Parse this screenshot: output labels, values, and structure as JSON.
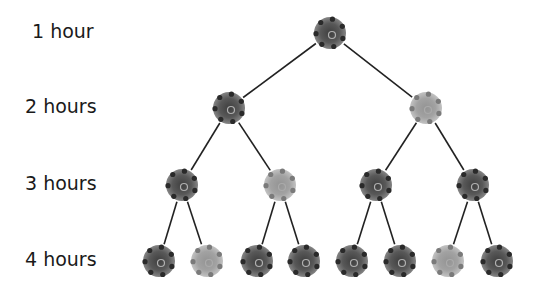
{
  "levels": [
    {
      "label": "1 hour",
      "y": 33,
      "cells": [
        {
          "x": 330,
          "shade": "dark"
        }
      ]
    },
    {
      "label": "2 hours",
      "y": 108,
      "cells": [
        {
          "x": 229,
          "shade": "dark"
        },
        {
          "x": 426,
          "shade": "light"
        }
      ]
    },
    {
      "label": "3 hours",
      "y": 185,
      "cells": [
        {
          "x": 182,
          "shade": "dark"
        },
        {
          "x": 280,
          "shade": "light"
        },
        {
          "x": 376,
          "shade": "dark"
        },
        {
          "x": 473,
          "shade": "dark"
        }
      ]
    },
    {
      "label": "4 hours",
      "y": 261,
      "cells": [
        {
          "x": 159,
          "shade": "dark"
        },
        {
          "x": 207,
          "shade": "light"
        },
        {
          "x": 257,
          "shade": "dark"
        },
        {
          "x": 304,
          "shade": "dark"
        },
        {
          "x": 352,
          "shade": "dark"
        },
        {
          "x": 400,
          "shade": "dark"
        },
        {
          "x": 448,
          "shade": "light"
        },
        {
          "x": 497,
          "shade": "dark"
        }
      ]
    }
  ],
  "colors": {
    "dark": "#4a4a4a",
    "light": "#9a9a9a",
    "line": "#222222",
    "text": "#1a1a1a"
  }
}
